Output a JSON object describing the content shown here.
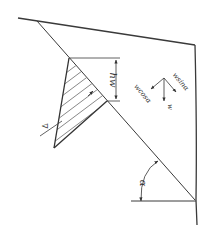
{
  "diagram": {
    "type": "slope-stability-water-pressure",
    "labels": {
      "water_height": "hw",
      "normal_component": "wcosα",
      "tangential_component": "wsinα",
      "weight": "w",
      "slope_angle": "α",
      "water_table_symbol": "∇"
    },
    "colors": {
      "line": "#3a3a3a",
      "hatch": "#555555",
      "background": "#ffffff"
    }
  }
}
